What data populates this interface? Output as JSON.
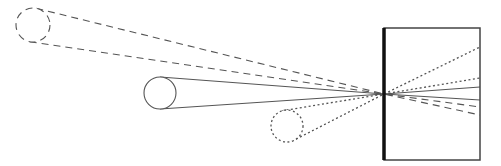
{
  "diagram": {
    "colors": {
      "stroke": "#555555",
      "plane": "#111111",
      "background": "#ffffff"
    },
    "pinhole": {
      "x": 384,
      "y": 94
    },
    "camera_box": {
      "x": 384,
      "y": 28,
      "width": 96,
      "height": 132
    },
    "objects": [
      {
        "name": "dashed-object",
        "style": "dashed",
        "cx": 33,
        "cy": 25,
        "r": 17,
        "rays_end": [
          107,
          115
        ]
      },
      {
        "name": "solid-object",
        "style": "solid",
        "cx": 160,
        "cy": 93,
        "r": 16,
        "rays_end": [
          87,
          100
        ]
      },
      {
        "name": "dotted-object",
        "style": "dotted",
        "cx": 287,
        "cy": 126,
        "r": 16,
        "rays_end": [
          47,
          78
        ]
      }
    ]
  }
}
